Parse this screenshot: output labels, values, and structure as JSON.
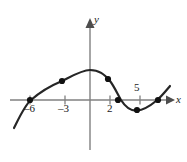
{
  "figure": {
    "name": "cubic-function-graph",
    "width": 187,
    "height": 162,
    "background_color": "#ffffff"
  },
  "axes": {
    "x_axis": {
      "label": "x",
      "color": "#808080",
      "arrow": "right",
      "pixel_y": 100,
      "pixel_x_start": 10,
      "pixel_x_end": 173
    },
    "y_axis": {
      "label": "y",
      "color": "#808080",
      "arrow": "up",
      "pixel_x": 90,
      "pixel_y_start": 18,
      "pixel_y_end": 150
    },
    "origin_pixel": {
      "x": 90,
      "y": 100
    },
    "units_per_pixel_x": 0.2,
    "tick_color": "#808080"
  },
  "tick_labels": [
    {
      "name": "x-tick-minus-6",
      "text": "–6",
      "value": -6,
      "pixel_x": 30,
      "position": "below-axis"
    },
    {
      "name": "x-tick-minus-3",
      "text": "–3",
      "value": -3,
      "pixel_x": 65,
      "position": "below-axis"
    },
    {
      "name": "x-tick-2",
      "text": "2",
      "value": 2,
      "pixel_x": 110,
      "position": "below-axis"
    },
    {
      "name": "x-tick-5",
      "text": "5",
      "value": 5,
      "pixel_x": 140,
      "position": "above-axis"
    }
  ],
  "chart_data": {
    "type": "line",
    "title": "",
    "xlabel": "x",
    "ylabel": "y",
    "grid": false,
    "legend": null,
    "curve_color": "#262626",
    "curve_width": 2.2,
    "point_color": "#111111",
    "point_radius": 3.1,
    "axis_ticks_x": [
      -6,
      -3,
      2,
      5
    ],
    "marked_points": [
      {
        "name": "point-root-minus-6",
        "label": "–6",
        "x": -6,
        "y": 0,
        "pixel_x": 30,
        "pixel_y": 100
      },
      {
        "name": "point-near-minus-3",
        "label": "",
        "x": -2.8,
        "y": 0.95,
        "pixel_x": 62,
        "pixel_y": 81
      },
      {
        "name": "point-descending",
        "label": "",
        "x": 1.1,
        "y": 1.05,
        "pixel_x": 108,
        "pixel_y": 79
      },
      {
        "name": "point-root-2",
        "label": "2",
        "x": 2.2,
        "y": 0,
        "pixel_x": 118,
        "pixel_y": 100
      },
      {
        "name": "point-local-minimum",
        "label": "",
        "x": 4.1,
        "y": -0.5,
        "pixel_x": 137,
        "pixel_y": 110
      },
      {
        "name": "point-root-6",
        "label": "",
        "x": 6.0,
        "y": 0,
        "pixel_x": 158,
        "pixel_y": 100
      }
    ],
    "curve_path_pixels": "M 14,128 C 20,116 25,105 31,100 C 40,92 50,86 62,81 C 72,76 82,70 90,70 C 99,70 104,74 110,81 C 114,86 118,95 121,100 C 126,108 131,111 137,110.5 C 144,110 150,106 156,101 C 161,97 165,92 170,86"
  },
  "colors": {
    "axis": "#808080",
    "curve": "#262626",
    "point": "#111111",
    "text": "#1a1a1a",
    "background": "#ffffff"
  }
}
